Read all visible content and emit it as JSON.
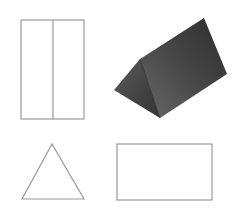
{
  "diagram": {
    "colors": {
      "background": "#ffffff",
      "line": "#9a9a9a",
      "solid_dark": "#2e2e2e",
      "solid_mid": "#555555",
      "solid_light": "#7a7a7a"
    },
    "views": [
      {
        "name": "front-view",
        "shape": "rectangle split by vertical center line",
        "x": 21,
        "y": 20,
        "width": 63,
        "height": 99,
        "divider_x": 53
      },
      {
        "name": "prism-3d",
        "shape": "triangular prism solid",
        "vertices": {
          "apex_front": [
            140,
            59
          ],
          "bottom_left_front": [
            114,
            90
          ],
          "bottom_right_front": [
            160,
            118
          ],
          "apex_back": [
            204,
            18
          ],
          "bottom_right_back": [
            227,
            74
          ]
        }
      },
      {
        "name": "side-view",
        "shape": "triangle",
        "points": [
          [
            52,
            144
          ],
          [
            22,
            199
          ],
          [
            84,
            199
          ]
        ]
      },
      {
        "name": "top-view",
        "shape": "rectangle",
        "x": 117,
        "y": 144,
        "width": 95,
        "height": 56
      }
    ]
  }
}
